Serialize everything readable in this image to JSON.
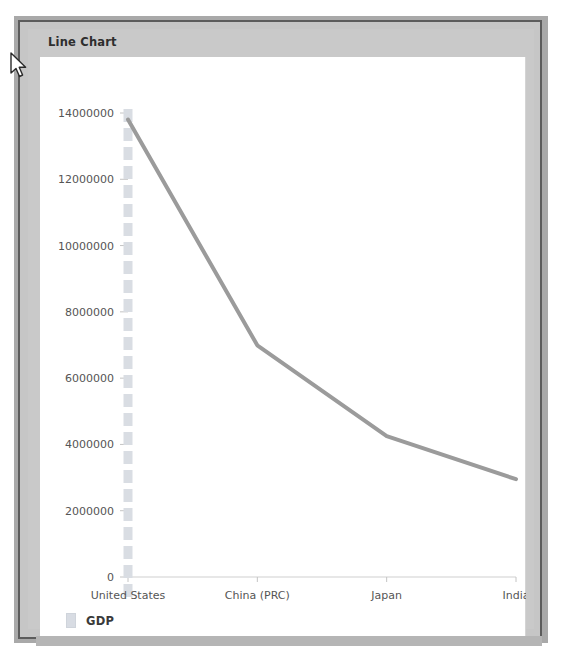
{
  "widget": {
    "title": "Line Chart"
  },
  "legend": {
    "swatch_color": "#d8dce3",
    "entries": [
      {
        "label": "GDP"
      }
    ]
  },
  "cursor": {
    "icon": "arrow-pointer-icon",
    "x": 12,
    "y": 57
  },
  "colors": {
    "line": "#9b9b9b",
    "crosshair": "#d9dde3",
    "axis": "#cfcfcf",
    "panel_background": "#ffffff",
    "chrome_background": "#c9c9c9",
    "frame_border": "#5c5c5c",
    "backdrop": "#a9a9a9",
    "tick_label": "#555555",
    "title_text": "#2e2e2e"
  },
  "chart_data": {
    "type": "line",
    "title": "Line Chart",
    "xlabel": "",
    "ylabel": "",
    "categories": [
      "United States",
      "China (PRC)",
      "Japan",
      "India"
    ],
    "series": [
      {
        "name": "GDP",
        "values": [
          13800000,
          6990000,
          4250000,
          2950000
        ]
      }
    ],
    "ylim": [
      0,
      14000000
    ],
    "yticks": [
      0,
      2000000,
      4000000,
      6000000,
      8000000,
      10000000,
      12000000,
      14000000
    ],
    "ytick_labels": [
      "0",
      "2000000",
      "4000000",
      "6000000",
      "8000000",
      "10000000",
      "12000000",
      "14000000"
    ],
    "grid": false,
    "crosshair_category": "United States",
    "legend_position": "bottom-left"
  }
}
